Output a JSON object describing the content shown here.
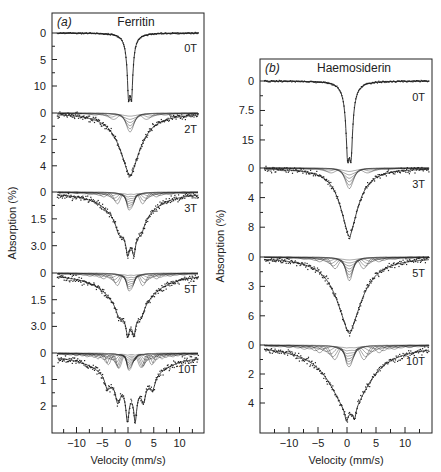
{
  "figure": {
    "background": "#ffffff",
    "ink_color": "#222222"
  },
  "chart_data": [
    {
      "type": "line",
      "panel_label": "(a)",
      "title": "Ferritin",
      "xlabel": "Velocity (mm/s)",
      "ylabel": "Absorption (%)",
      "xlim": [
        -14,
        14
      ],
      "x_ticks": [
        -10,
        -5,
        0,
        5,
        10
      ],
      "x_tick_labels": [
        "−10",
        "−5",
        "0",
        "5",
        "10"
      ],
      "frame_px": {
        "left": 52,
        "right": 204,
        "top": 13,
        "bottom": 433
      },
      "x_zero_px": 128,
      "x_px_per_unit": 5.15,
      "grid": false,
      "legend": "none (field labels placed at right of each spectrum)",
      "series": [
        {
          "name": "0T",
          "field_T": 0,
          "baseline_px": 33,
          "px_per_unit": 5.3,
          "y_ticks": [
            0,
            5,
            10
          ],
          "y_tick_labels": [
            "0",
            "5",
            "10"
          ],
          "shape": "doublet",
          "depth_pct": 12.5,
          "centre_mm_s": 0.4,
          "half_width_mm_s": 0.45,
          "split_mm_s": 0.6,
          "fit_components": 0
        },
        {
          "name": "2T",
          "field_T": 2,
          "baseline_px": 113,
          "px_per_unit": 13.2,
          "y_ticks": [
            0,
            2,
            4
          ],
          "y_tick_labels": [
            "0",
            "2",
            "4"
          ],
          "shape": "broad",
          "depth_pct": 4.8,
          "centre_mm_s": 0.4,
          "half_width_mm_s": 2.6,
          "fit_components": 6
        },
        {
          "name": "3T",
          "field_T": 3,
          "baseline_px": 192,
          "px_per_unit": 17.9,
          "y_ticks": [
            0,
            1.5,
            3.0
          ],
          "y_tick_labels": [
            "0",
            "1.5",
            "3.0"
          ],
          "shape": "broad-structured",
          "depth_pct": 3.6,
          "centre_mm_s": 0.4,
          "half_width_mm_s": 3.6,
          "fit_components": 8
        },
        {
          "name": "5T",
          "field_T": 5,
          "baseline_px": 273,
          "px_per_unit": 17.8,
          "y_ticks": [
            0,
            1.5,
            3.0
          ],
          "y_tick_labels": [
            "0",
            "1.5",
            "3.0"
          ],
          "shape": "broad-structured",
          "depth_pct": 3.6,
          "centre_mm_s": 0.4,
          "half_width_mm_s": 4.2,
          "fit_components": 8
        },
        {
          "name": "10T",
          "field_T": 10,
          "baseline_px": 353,
          "px_per_unit": 26.5,
          "y_ticks": [
            0,
            1,
            2
          ],
          "y_tick_labels": [
            "0",
            "1",
            "2"
          ],
          "shape": "sextet-like",
          "depth_pct": 2.6,
          "centre_mm_s": 0.4,
          "half_width_mm_s": 5.5,
          "fit_components": 10
        }
      ]
    },
    {
      "type": "line",
      "panel_label": "(b)",
      "title": "Haemosiderin",
      "xlabel": "Velocity (mm/s)",
      "ylabel": "Absorption (%)",
      "xlim": [
        -14.5,
        14.5
      ],
      "x_ticks": [
        -10,
        -5,
        0,
        5,
        10
      ],
      "x_tick_labels": [
        "−10",
        "−5",
        "0",
        "5",
        "10"
      ],
      "frame_px": {
        "left": 260,
        "right": 432,
        "top": 59,
        "bottom": 433
      },
      "x_zero_px": 347,
      "x_px_per_unit": 5.8,
      "grid": false,
      "legend": "none (field labels placed at right of each spectrum)",
      "series": [
        {
          "name": "0T",
          "field_T": 0,
          "baseline_px": 81,
          "px_per_unit": 3.93,
          "y_ticks": [
            0,
            7.5,
            15
          ],
          "y_tick_labels": [
            "0",
            "7.5",
            "15"
          ],
          "shape": "doublet",
          "depth_pct": 19.5,
          "centre_mm_s": 0.4,
          "half_width_mm_s": 0.5,
          "split_mm_s": 0.6,
          "fit_components": 0
        },
        {
          "name": "3T",
          "field_T": 3,
          "baseline_px": 168,
          "px_per_unit": 7.4,
          "y_ticks": [
            0,
            4,
            8
          ],
          "y_tick_labels": [
            "0",
            "4",
            "8"
          ],
          "shape": "broad",
          "depth_pct": 9.3,
          "centre_mm_s": 0.4,
          "half_width_mm_s": 2.0,
          "fit_components": 6
        },
        {
          "name": "5T",
          "field_T": 5,
          "baseline_px": 257,
          "px_per_unit": 9.8,
          "y_ticks": [
            0,
            3,
            6
          ],
          "y_tick_labels": [
            "0",
            "3",
            "6"
          ],
          "shape": "broad",
          "depth_pct": 7.8,
          "centre_mm_s": 0.4,
          "half_width_mm_s": 2.8,
          "fit_components": 8
        },
        {
          "name": "10T",
          "field_T": 10,
          "baseline_px": 345,
          "px_per_unit": 14.5,
          "y_ticks": [
            0,
            2,
            4
          ],
          "y_tick_labels": [
            "0",
            "2",
            "4"
          ],
          "shape": "broad-doublet-tip",
          "depth_pct": 5.3,
          "centre_mm_s": 0.4,
          "half_width_mm_s": 4.0,
          "fit_components": 8
        }
      ]
    }
  ]
}
